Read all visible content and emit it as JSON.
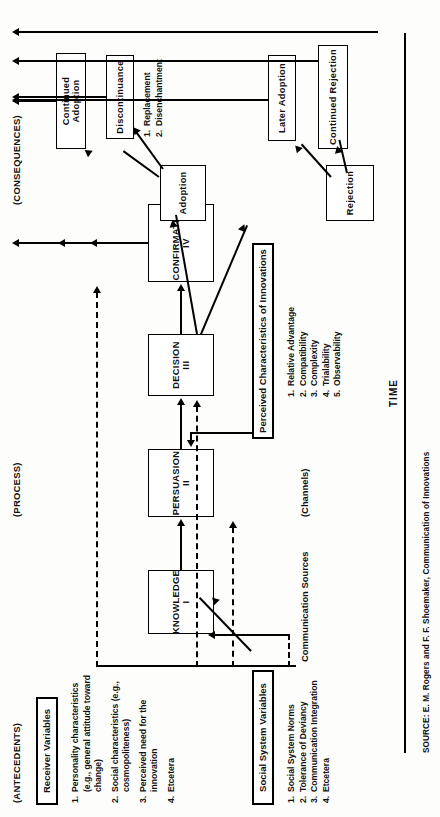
{
  "figure": {
    "source": "SOURCE: E. M. Rogers and F. F. Shoemaker, Communication of Innovations",
    "time_axis_label": "TIME"
  },
  "sections": {
    "antecedents": "(ANTECEDENTS)",
    "process": "(PROCESS)",
    "consequences": "(CONSEQUENCES)"
  },
  "antecedents": {
    "receiver_variables_heading": "Receiver Variables",
    "receiver_variables": [
      {
        "n": "1.",
        "text": "Personality\ncharacteristics\n(e.g., general\nattitude toward\nchange)"
      },
      {
        "n": "2.",
        "text": "Social\ncharacteristics\n(e.g., cosmopoliteness)"
      },
      {
        "n": "3.",
        "text": "Perceived need for\nthe innovation"
      },
      {
        "n": "4.",
        "text": "Etcetera"
      }
    ],
    "social_system_heading": "Social System Variables",
    "social_system_variables": [
      {
        "n": "1.",
        "text": "Social System Norms"
      },
      {
        "n": "2.",
        "text": "Tolerance of Deviancy"
      },
      {
        "n": "3.",
        "text": "Communication Integration"
      },
      {
        "n": "4.",
        "text": "Etcetera"
      }
    ]
  },
  "process": {
    "communication_sources": "Communication Sources",
    "channels": "(Channels)",
    "stages": [
      {
        "name": "KNOWLEDGE",
        "numeral": "I"
      },
      {
        "name": "PERSUASION",
        "numeral": "II"
      },
      {
        "name": "DECISION",
        "numeral": "III"
      },
      {
        "name": "CONFIRMATION",
        "numeral": "IV"
      }
    ],
    "perceived_characteristics_heading": "Perceived Characteristics of Innovations",
    "perceived_characteristics": [
      {
        "n": "1.",
        "text": "Relative Advantage"
      },
      {
        "n": "2.",
        "text": "Compatibility"
      },
      {
        "n": "3.",
        "text": "Complexity"
      },
      {
        "n": "4.",
        "text": "Trialability"
      },
      {
        "n": "5.",
        "text": "Observability"
      }
    ]
  },
  "consequences": {
    "adoption": "Adoption",
    "continued_adoption": "Continued Adoption",
    "discontinuance": "Discontinuance",
    "discontinuance_types": [
      {
        "n": "1.",
        "text": "Replacement"
      },
      {
        "n": "2.",
        "text": "Disenchantment"
      }
    ],
    "rejection": "Rejection",
    "later_adoption": "Later Adoption",
    "continued_rejection": "Continued Rejection"
  }
}
